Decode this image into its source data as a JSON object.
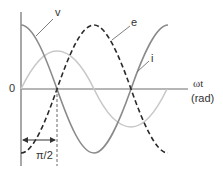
{
  "diagram": {
    "type": "phase waveform diagram",
    "axis": {
      "origin_label": "0",
      "x_label_line1": "ωt",
      "x_label_line2": "(rad)"
    },
    "curves": [
      {
        "name": "v",
        "label": "v",
        "style": "solid",
        "color": "#8a8a8a",
        "shape": "cosine"
      },
      {
        "name": "e",
        "label": "e",
        "style": "dashed",
        "color": "#2a2a2a",
        "shape": "-cosine (v shifted by π)"
      },
      {
        "name": "i",
        "label": "i",
        "style": "solid",
        "color": "#c8c8c8",
        "shape": "sine (lags v by π/2), smaller amplitude"
      }
    ],
    "annotation": {
      "label": "π/2",
      "description": "double-headed arrow from origin to first zero crossing of v"
    }
  },
  "labels": {
    "v": "v",
    "e": "e",
    "i": "i",
    "zero": "0",
    "omega_t": "ωt",
    "rad": "(rad)",
    "pi_over_2": "π/2"
  }
}
